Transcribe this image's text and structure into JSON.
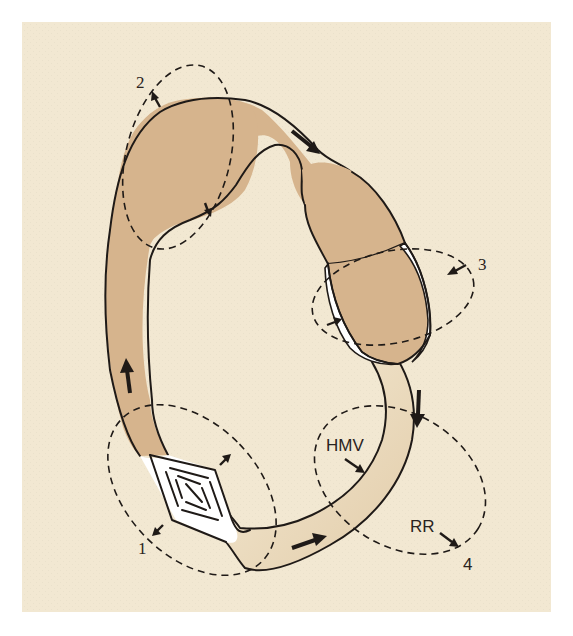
{
  "figure": {
    "colors": {
      "panel_background": "#f2e8d2",
      "venous_fill": "#d6b48d",
      "arterial_fill_light": "#f4ead4",
      "arterial_fill_dark": "#e2cca9",
      "ink": "#1f1a17",
      "white_space": "#ffffff"
    },
    "regions": [
      {
        "id": "1",
        "label": "1",
        "description": "capillary / exchange bed (diamond)"
      },
      {
        "id": "2",
        "label": "2",
        "description": "venous reservoir"
      },
      {
        "id": "3",
        "label": "3",
        "description": "heart chamber with pericardial space"
      },
      {
        "id": "4",
        "label": "4",
        "description": "arterial resistance",
        "annotations": [
          "HMV",
          "RR"
        ]
      }
    ],
    "labels": {
      "region_1": "1",
      "region_2": "2",
      "region_3": "3",
      "region_4": "4",
      "hmv": "HMV",
      "rr": "RR"
    },
    "flow_direction": "clockwise"
  }
}
